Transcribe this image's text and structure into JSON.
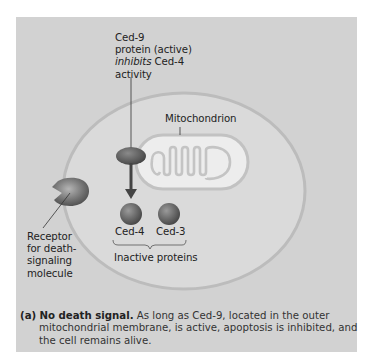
{
  "figure": {
    "ced9_label": {
      "line1": "Ced-9",
      "line2": "protein (active)",
      "line3_italic": "inhibits",
      "line3_rest": " Ced-4",
      "line4": "activity"
    },
    "mitochondrion_label": "Mitochondrion",
    "receptor_label": {
      "line1": "Receptor",
      "line2": "for death-",
      "line3": "signaling",
      "line4": "molecule"
    },
    "proteins": [
      {
        "label": "Ced-4"
      },
      {
        "label": "Ced-3"
      }
    ],
    "group_label": "Inactive proteins",
    "colors": {
      "panel": "#d2d2d2",
      "cell_fill": "#dcdcdc",
      "cell_outline": "#bdbdbd",
      "mitochondrion_fill": "#ececec",
      "protein": "#6a6a6a",
      "arrow": "#4a4a4a"
    }
  },
  "caption": {
    "tag": "(a)",
    "lead": "No death signal.",
    "line1_rest": " As long as Ced-9, located in the outer",
    "line2": "mitochondrial membrane, is active, apoptosis is inhibited, and",
    "line3": "the cell remains alive."
  }
}
